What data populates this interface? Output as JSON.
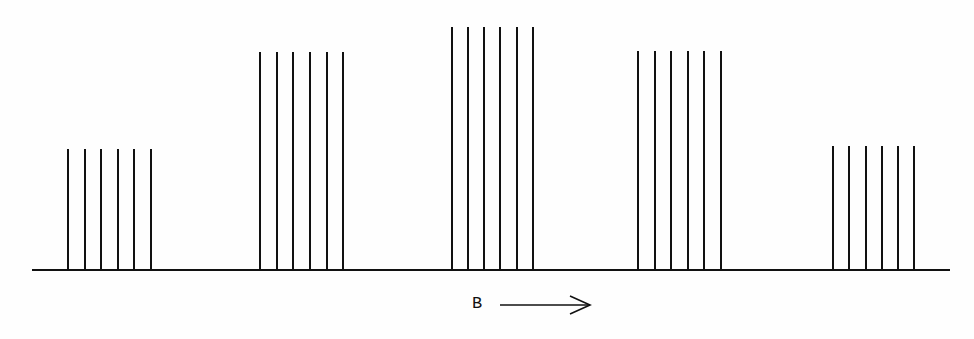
{
  "diagram": {
    "stroke_color": "#111111",
    "baseline": {
      "x1": 32,
      "x2": 950,
      "y": 270
    },
    "groups": [
      {
        "id": 1,
        "top_y": 149,
        "height": 121,
        "x": [
          68,
          85,
          101,
          118,
          134,
          151
        ]
      },
      {
        "id": 2,
        "top_y": 52,
        "height": 218,
        "x": [
          260,
          277,
          293,
          310,
          327,
          343
        ]
      },
      {
        "id": 3,
        "top_y": 27,
        "height": 243,
        "x": [
          452,
          468,
          484,
          500,
          517,
          533
        ]
      },
      {
        "id": 4,
        "top_y": 51,
        "height": 219,
        "x": [
          638,
          655,
          671,
          688,
          704,
          721
        ]
      },
      {
        "id": 5,
        "top_y": 146,
        "height": 124,
        "x": [
          833,
          849,
          866,
          882,
          898,
          914
        ]
      }
    ],
    "field_label": "B",
    "arrow": {
      "x1": 500,
      "x2": 590,
      "y": 305,
      "direction": "right"
    }
  }
}
